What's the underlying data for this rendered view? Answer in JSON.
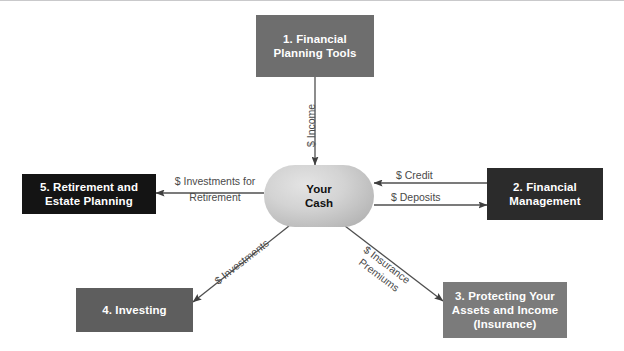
{
  "diagram": {
    "hub": {
      "label_line1": "Your",
      "label_line2": "Cash",
      "fill": "#c6c6c6"
    },
    "nodes": [
      {
        "id": "financial-planning-tools",
        "number": "1.",
        "line1": "1. Financial",
        "line2": "Planning Tools",
        "line3": "",
        "fill": "#6e6e6e"
      },
      {
        "id": "financial-management",
        "number": "2.",
        "line1": "2. Financial",
        "line2": "Management",
        "line3": "",
        "fill": "#2b2b2b"
      },
      {
        "id": "protecting-your-assets-and-income",
        "number": "3.",
        "line1": "3. Protecting Your",
        "line2": "Assets and Income",
        "line3": "(Insurance)",
        "fill": "#7b7b7b"
      },
      {
        "id": "investing",
        "number": "4.",
        "line1": "4. Investing",
        "line2": "",
        "line3": "",
        "fill": "#5e5e5e"
      },
      {
        "id": "retirement-and-estate-planning",
        "number": "5.",
        "line1": "5. Retirement and",
        "line2": "Estate Planning",
        "line3": "",
        "fill": "#141414"
      }
    ],
    "edges": [
      {
        "id": "income",
        "label": "$ Income",
        "from": "financial-planning-tools",
        "to": "hub",
        "direction": "down"
      },
      {
        "id": "investments-for-retirement",
        "label_line1": "$ Investments for",
        "label_line2": "Retirement",
        "from": "hub",
        "to": "retirement-and-estate-planning",
        "direction": "left"
      },
      {
        "id": "credit",
        "label": "$ Credit",
        "from": "financial-management",
        "to": "hub",
        "direction": "left"
      },
      {
        "id": "deposits",
        "label": "$ Deposits",
        "from": "hub",
        "to": "financial-management",
        "direction": "right"
      },
      {
        "id": "investments",
        "label": "$ Investments",
        "from": "hub",
        "to": "investing",
        "direction": "down-left"
      },
      {
        "id": "insurance-premiums",
        "label_line1": "$ Insurance",
        "label_line2": "Premiums",
        "from": "hub",
        "to": "protecting-your-assets-and-income",
        "direction": "down-right"
      }
    ],
    "colors": {
      "line": "#4f4f4f",
      "label_text": "#4a4a4a",
      "node_text": "#ffffff",
      "hub_text": "#111111",
      "background": "#ffffff",
      "frame_rule": "#c9c9cb"
    }
  }
}
